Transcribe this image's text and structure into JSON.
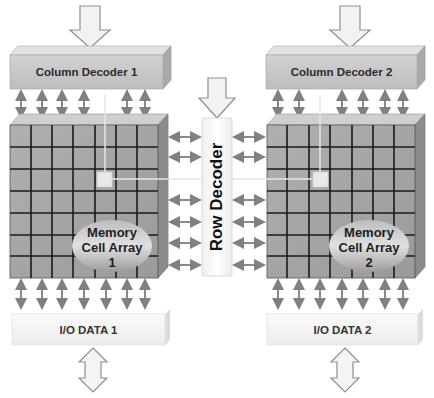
{
  "diagram": {
    "column_decoders": [
      {
        "label": "Column Decoder 1"
      },
      {
        "label": "Column Decoder 2"
      }
    ],
    "row_decoder": {
      "label": "Row Decoder"
    },
    "memory_arrays": [
      {
        "line1": "Memory",
        "line2": "Cell Array",
        "line3": "1",
        "rows": 7,
        "cols": 7
      },
      {
        "line1": "Memory",
        "line2": "Cell Array",
        "line3": "2",
        "rows": 7,
        "cols": 7
      }
    ],
    "io_blocks": [
      {
        "label": "I/O DATA 1"
      },
      {
        "label": "I/O DATA 2"
      }
    ],
    "colors": {
      "decoder_fill": "#c9c9c9",
      "array_fill": "#a9a9a9",
      "grid_line": "#1a1a1a",
      "arrow_gray": "#8a8a8a",
      "selected_cell": "#e8e8e8",
      "io_fill": "#f4f4f4"
    }
  }
}
